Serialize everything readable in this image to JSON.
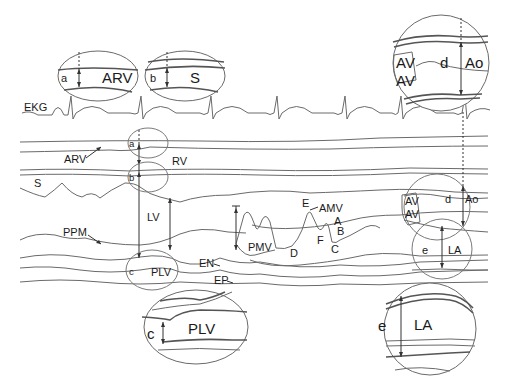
{
  "figure": {
    "type": "M-mode echocardiogram schematic",
    "trace_labels": {
      "ekg": "EKG",
      "arv": "ARV",
      "rv": "RV",
      "s": "S",
      "lv": "LV",
      "ppm": "PPM",
      "pmv": "PMV",
      "en": "EN",
      "ep": "EP",
      "plv": "PLV",
      "amv": "AMV",
      "av_upper": "AV",
      "av_lower": "AV",
      "ao": "Ao",
      "la": "LA"
    },
    "mitral_points": {
      "e": "E",
      "a": "A",
      "b": "B",
      "c": "C",
      "d": "D",
      "f": "F"
    },
    "measurements": {
      "a": "a",
      "b": "b",
      "c": "c",
      "d": "d",
      "e": "e"
    },
    "insets": {
      "arv": {
        "measure": "a",
        "label": "ARV"
      },
      "s": {
        "measure": "b",
        "label": "S"
      },
      "aorta": {
        "measure": "d",
        "label_ao": "Ao",
        "label_av1": "AV",
        "label_av2": "AV"
      },
      "plv": {
        "measure": "c",
        "label": "PLV"
      },
      "la": {
        "measure": "e",
        "label": "LA"
      }
    }
  }
}
